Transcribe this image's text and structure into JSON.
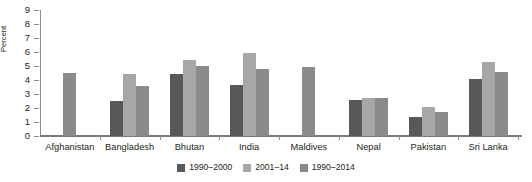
{
  "chart_data": {
    "type": "bar",
    "title": "",
    "xlabel": "",
    "ylabel": "Percent",
    "ylim": [
      0,
      9
    ],
    "ytick_values": [
      0,
      1,
      2,
      3,
      4,
      5,
      6,
      7,
      8,
      9
    ],
    "ytick_labels": [
      "0",
      "1",
      "2",
      "3",
      "4",
      "5",
      "6",
      "7",
      "8",
      "9"
    ],
    "grid": false,
    "legend_position": "bottom-center",
    "categories": [
      "Afghanistan",
      "Bangladesh",
      "Bhutan",
      "India",
      "Maldives",
      "Nepal",
      "Pakistan",
      "Sri Lanka"
    ],
    "series": [
      {
        "name": "1990–2000",
        "color": "#58585a",
        "values": [
          null,
          2.5,
          4.45,
          3.65,
          null,
          2.55,
          1.35,
          4.05
        ]
      },
      {
        "name": "2001–14",
        "color": "#a7a7a9",
        "values": [
          null,
          4.45,
          5.4,
          5.9,
          null,
          2.75,
          2.1,
          5.3
        ]
      },
      {
        "name": "1990–2014",
        "color": "#8b8b8d",
        "values": [
          4.5,
          3.6,
          5.0,
          4.8,
          4.95,
          2.7,
          1.7,
          4.55
        ]
      }
    ]
  },
  "legend": {
    "items": [
      {
        "label": "1990–2000",
        "color": "#58585a"
      },
      {
        "label": "2001–14",
        "color": "#a7a7a9"
      },
      {
        "label": "1990–2014",
        "color": "#8b8b8d"
      }
    ]
  }
}
